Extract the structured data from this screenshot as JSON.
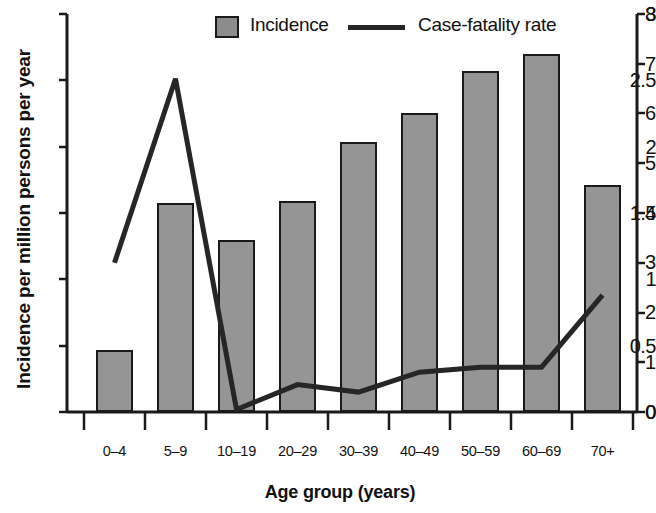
{
  "chart_data": {
    "type": "bar",
    "title": "",
    "subtitle": "",
    "xlabel": "Age group (years)",
    "ylabel": "Incidence per million persons per year",
    "ylabel_right": "",
    "categories": [
      "0–4",
      "5–9",
      "10–19",
      "20–29",
      "30–39",
      "40–49",
      "50–59",
      "60–69",
      "70+"
    ],
    "ylim": [
      0,
      3
    ],
    "yticks": [
      "0",
      "0.5",
      "1",
      "1.5",
      "2",
      "2.5",
      "3"
    ],
    "ytick_values": [
      0,
      0.5,
      1,
      1.5,
      2,
      2.5,
      3
    ],
    "ylim_right": [
      0,
      8
    ],
    "yticks_right": [
      "0",
      "1",
      "2",
      "3",
      "4",
      "5",
      "6",
      "7",
      "8"
    ],
    "ytick_values_right": [
      0,
      1,
      2,
      3,
      4,
      5,
      6,
      7,
      8
    ],
    "grid": false,
    "legend_position": "top",
    "series": [
      {
        "name": "Incidence",
        "type": "bar",
        "axis": "left",
        "color": "#959595",
        "edge_color": "#1a1a1a",
        "values": [
          0.6,
          1.58,
          1.3,
          1.6,
          2.04,
          2.26,
          2.58,
          2.71,
          1.71
        ]
      },
      {
        "name": "Case-fatality rate",
        "type": "line",
        "axis": "right",
        "color": "#262626",
        "values": [
          3.0,
          6.7,
          0.05,
          0.55,
          0.4,
          0.8,
          0.9,
          0.9,
          2.35
        ]
      }
    ]
  },
  "legend": {
    "items": [
      {
        "label": "Incidence",
        "marker": "square-swatch"
      },
      {
        "label": "Case-fatality rate",
        "marker": "line-segment"
      }
    ]
  }
}
